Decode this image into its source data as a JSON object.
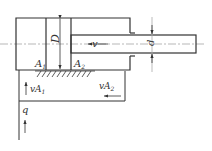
{
  "diagram": {
    "labels": {
      "bore_diameter": "D",
      "rod_diameter": "d",
      "velocity": "v",
      "area_cap": "A",
      "area_cap_sub": "1",
      "area_rod": "A",
      "area_rod_sub": "2",
      "flow_in": "q",
      "flow_cap": "vA",
      "flow_cap_sub": "1",
      "flow_rod": "vA",
      "flow_rod_sub": "2"
    },
    "colors": {
      "line": "#333333",
      "centerline": "#999999",
      "background": "#ffffff"
    }
  }
}
